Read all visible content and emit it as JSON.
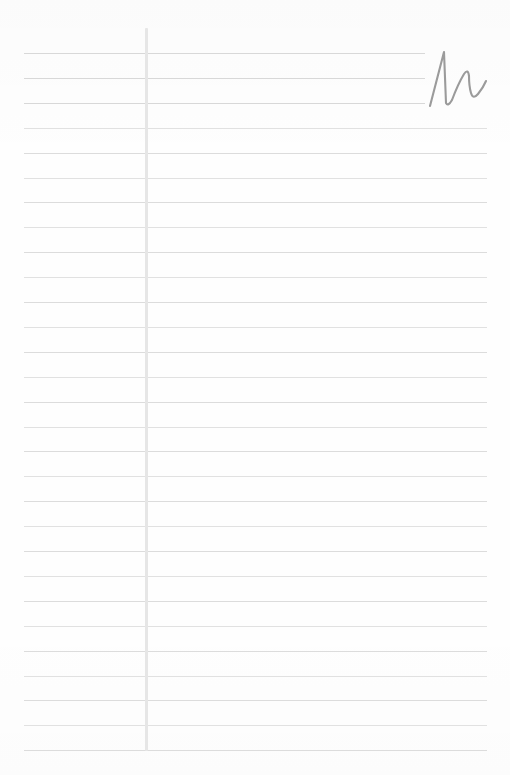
{
  "page": {
    "kind": "lined-notebook-page",
    "width": 510,
    "height": 775,
    "background_color": "#fefefe",
    "title": "",
    "body_text": ""
  },
  "colors": {
    "rule_line": "#dcdcdc",
    "rule_line_soft": "#e1e1e1",
    "margin_rule": "#e6e6e6",
    "ink": "#9b9b9b",
    "paper": "#fefefe"
  },
  "ruling": {
    "line_count": 29,
    "first_line_y": 53,
    "line_spacing": 24.9,
    "line_start_x": 24,
    "line_end_x": 487,
    "interrupted_line_end_x": 425,
    "interrupted_line_indices": [
      0,
      1,
      2
    ],
    "line_thickness": 1
  },
  "margin_rule": {
    "x": 145,
    "top_y": 28,
    "bottom_y": 751,
    "thickness": 3
  },
  "handwriting": {
    "glyph": "M",
    "script": "cursive",
    "transcription": "M",
    "x": 424,
    "y": 48,
    "width": 64,
    "height": 62,
    "stroke_color": "#9b9b9b",
    "path": "M 6 58 L 20 4 L 22 55 Q 24 59 28 52 Q 34 36 40 26 Q 44 20 45 28 Q 45 38 47 45 Q 49 52 54 46 Q 59 40 62 33"
  }
}
